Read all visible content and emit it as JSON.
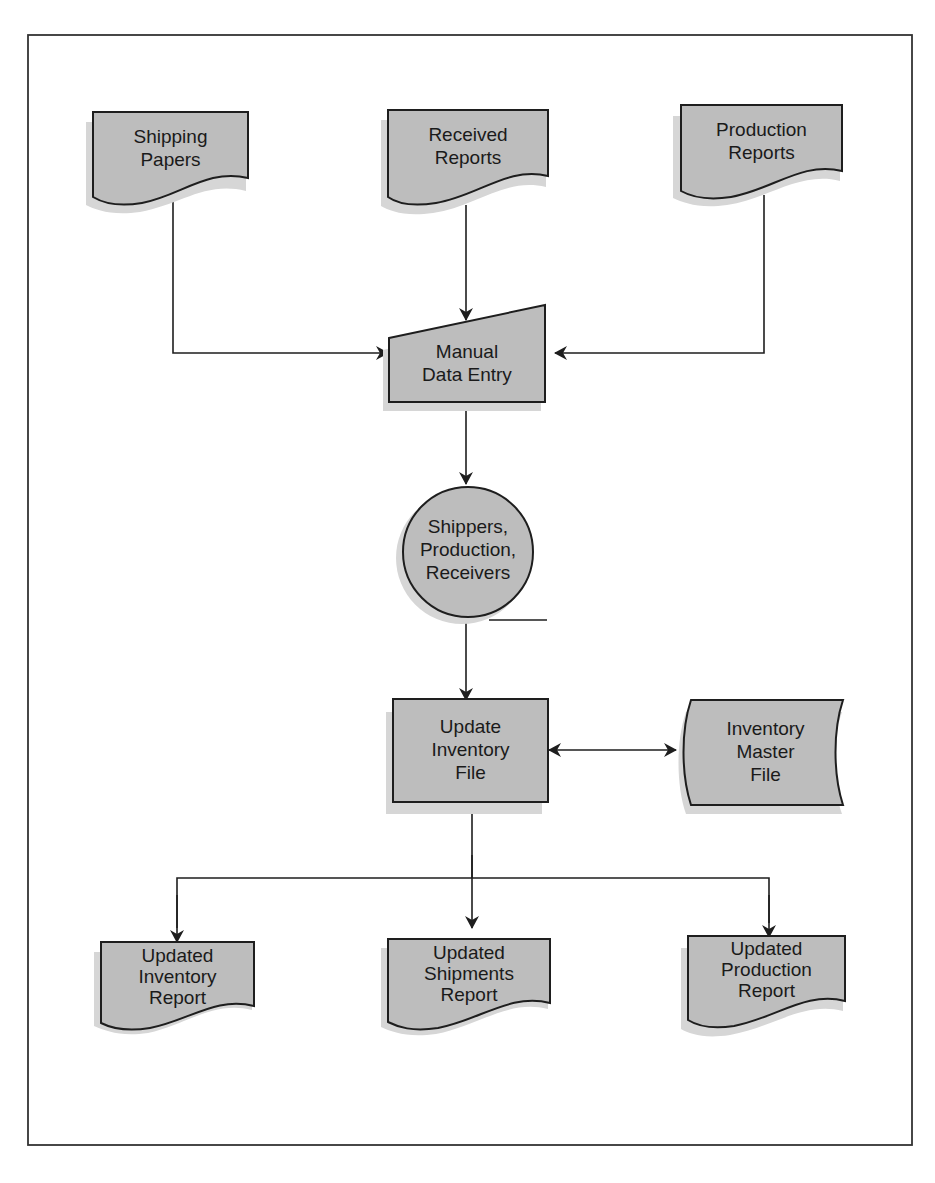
{
  "diagram": {
    "type": "system flowchart",
    "colors": {
      "shape_fill": "#bdbdbd",
      "shadow": "#d6d6d6",
      "stroke": "#1e1e1e",
      "background": "#ffffff"
    },
    "nodes": {
      "shipping_papers": {
        "shape": "document",
        "lines": [
          "Shipping",
          "Papers"
        ]
      },
      "received_reports": {
        "shape": "document",
        "lines": [
          "Received",
          "Reports"
        ]
      },
      "production_reports": {
        "shape": "document",
        "lines": [
          "Production",
          "Reports"
        ]
      },
      "manual_entry": {
        "shape": "manual-input",
        "lines": [
          "Manual",
          "Data Entry"
        ]
      },
      "connector": {
        "shape": "circle",
        "lines": [
          "Shippers,",
          "Production,",
          "Receivers"
        ]
      },
      "update_inventory": {
        "shape": "process",
        "lines": [
          "Update",
          "Inventory",
          "File"
        ]
      },
      "master_file": {
        "shape": "stored-data",
        "lines": [
          "Inventory",
          "Master",
          "File"
        ]
      },
      "updated_inventory": {
        "shape": "document",
        "lines": [
          "Updated",
          "Inventory",
          "Report"
        ]
      },
      "updated_shipments": {
        "shape": "document",
        "lines": [
          "Updated",
          "Shipments",
          "Report"
        ]
      },
      "updated_production": {
        "shape": "document",
        "lines": [
          "Updated",
          "Production",
          "Report"
        ]
      }
    },
    "edges": [
      {
        "from": "Shipping Papers",
        "to": "Manual Data Entry"
      },
      {
        "from": "Received Reports",
        "to": "Manual Data Entry"
      },
      {
        "from": "Production Reports",
        "to": "Manual Data Entry"
      },
      {
        "from": "Manual Data Entry",
        "to": "Shippers, Production, Receivers"
      },
      {
        "from": "Shippers, Production, Receivers",
        "to": "Update Inventory File"
      },
      {
        "from": "Update Inventory File",
        "to": "Inventory Master File",
        "bidirectional": true
      },
      {
        "from": "Update Inventory File",
        "to": "Updated Inventory Report"
      },
      {
        "from": "Update Inventory File",
        "to": "Updated Shipments Report"
      },
      {
        "from": "Update Inventory File",
        "to": "Updated Production Report"
      }
    ]
  }
}
